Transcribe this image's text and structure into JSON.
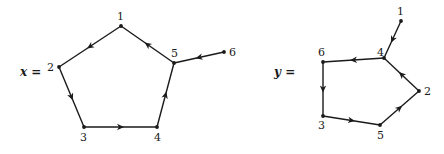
{
  "graphs": [
    {
      "id": "x",
      "eq_label": "x =",
      "eq_pos": [
        20,
        76
      ],
      "nodes": [
        {
          "id": "1",
          "label": "1",
          "x": 121,
          "y": 26,
          "lx": 117,
          "ly": 20
        },
        {
          "id": "2",
          "label": "2",
          "x": 59,
          "y": 67,
          "lx": 47,
          "ly": 71
        },
        {
          "id": "3",
          "label": "3",
          "x": 84,
          "y": 127,
          "lx": 80,
          "ly": 141
        },
        {
          "id": "4",
          "label": "4",
          "x": 157,
          "y": 127,
          "lx": 154,
          "ly": 141
        },
        {
          "id": "5",
          "label": "5",
          "x": 174,
          "y": 63,
          "lx": 171,
          "ly": 57
        },
        {
          "id": "6",
          "label": "6",
          "x": 224,
          "y": 52,
          "lx": 229,
          "ly": 56
        }
      ],
      "edges": [
        {
          "from": "1",
          "to": "2"
        },
        {
          "from": "2",
          "to": "3"
        },
        {
          "from": "3",
          "to": "4"
        },
        {
          "from": "4",
          "to": "5"
        },
        {
          "from": "5",
          "to": "1"
        },
        {
          "from": "6",
          "to": "5"
        }
      ]
    },
    {
      "id": "y",
      "eq_label": "y =",
      "eq_pos": [
        274,
        76
      ],
      "nodes": [
        {
          "id": "1",
          "label": "1",
          "x": 401,
          "y": 21,
          "lx": 397,
          "ly": 15
        },
        {
          "id": "2",
          "label": "2",
          "x": 419,
          "y": 91,
          "lx": 424,
          "ly": 95
        },
        {
          "id": "3",
          "label": "3",
          "x": 323,
          "y": 116,
          "lx": 318,
          "ly": 129
        },
        {
          "id": "4",
          "label": "4",
          "x": 384,
          "y": 58,
          "lx": 377,
          "ly": 56
        },
        {
          "id": "5",
          "label": "5",
          "x": 380,
          "y": 125,
          "lx": 377,
          "ly": 139
        },
        {
          "id": "6",
          "label": "6",
          "x": 323,
          "y": 62,
          "lx": 318,
          "ly": 56
        }
      ],
      "edges": [
        {
          "from": "1",
          "to": "4"
        },
        {
          "from": "4",
          "to": "6"
        },
        {
          "from": "6",
          "to": "3"
        },
        {
          "from": "3",
          "to": "5"
        },
        {
          "from": "5",
          "to": "2"
        },
        {
          "from": "2",
          "to": "4"
        }
      ]
    }
  ]
}
